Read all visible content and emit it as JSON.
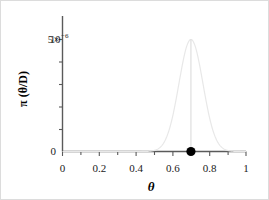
{
  "chart_data": {
    "type": "line",
    "title": "",
    "subtitle": "",
    "xlabel": "θ",
    "ylabel": "π (θ/D)",
    "ylabel_pi": "π",
    "ylabel_arg": "(θ/D)",
    "xlim": [
      0,
      1
    ],
    "ylim": [
      0,
      5e-06
    ],
    "grid": false,
    "legend": null,
    "xticks": [
      0,
      0.2,
      0.4,
      0.6,
      0.8,
      1
    ],
    "xtick_labels": [
      "0",
      "0.2",
      "0.4",
      "0.6",
      "0.8",
      "1"
    ],
    "xminor_ticks": [
      0.1,
      0.3,
      0.5,
      0.7,
      0.9
    ],
    "yticks": [
      0,
      5e-06
    ],
    "ytick_labels": [
      "0",
      "5×10⁻⁶"
    ],
    "ytick_label_zero": "0",
    "ytick_label_top_mantissa": "5",
    "ytick_label_top_times": "×",
    "ytick_label_top_base": "10",
    "ytick_label_top_exponent": "−6",
    "yminor_ticks": [
      1e-06,
      2e-06,
      3e-06,
      4e-06
    ],
    "series": [
      {
        "name": "posterior",
        "kind": "curve",
        "color": "#e8e8e8",
        "distribution": "normal",
        "mean": 0.7,
        "sigma": 0.0655,
        "peak_value": 5e-06,
        "x": [
          0.4,
          0.42,
          0.44,
          0.46,
          0.48,
          0.5,
          0.52,
          0.54,
          0.56,
          0.58,
          0.6,
          0.62,
          0.64,
          0.66,
          0.68,
          0.7,
          0.72,
          0.74,
          0.76,
          0.78,
          0.8,
          0.82,
          0.84,
          0.86,
          0.88,
          0.9,
          0.92,
          0.94
        ],
        "y": [
          0.0,
          0.0,
          1e-07,
          2e-07,
          6e-07,
          1.8e-06,
          4.7e-06,
          1.13e-05,
          2.49e-05,
          5.03e-05,
          9.31e-05,
          0.000158,
          0.0002459,
          0.0003506,
          0.0004581,
          0.0005,
          0.0004581,
          0.0003506,
          0.0002459,
          0.000158,
          9.31e-05,
          5.03e-05,
          2.49e-05,
          1.13e-05,
          4.7e-06,
          1.8e-06,
          6e-07,
          2e-07
        ]
      }
    ],
    "annotations": [
      {
        "name": "mode-marker",
        "kind": "point",
        "x": 0.7,
        "y": 0,
        "color": "#000000",
        "marker": "filled-circle"
      },
      {
        "name": "mode-vertical-line",
        "kind": "vline",
        "x": 0.7,
        "y_from": 0,
        "y_to": 5e-06,
        "color": "#d8d8d8"
      }
    ]
  },
  "style": {
    "background": "#ffffff",
    "border_color": "#dcdcdc",
    "axis_color": "#5a5a5a",
    "curve_color": "#e8e8e8",
    "marker_color": "#000000",
    "text_color": "#1a1a1a"
  }
}
